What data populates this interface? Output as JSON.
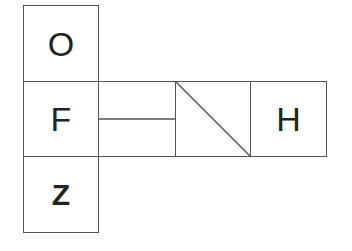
{
  "diagram": {
    "type": "cube-net",
    "stroke_color": "#555555",
    "glyph_color": "#222222",
    "faces": [
      {
        "id": "top",
        "label": "O",
        "position": "column-top"
      },
      {
        "id": "middle-left",
        "label": "F",
        "position": "column-middle"
      },
      {
        "id": "bottom",
        "label": "Z",
        "position": "column-bottom"
      },
      {
        "id": "horizontal-split",
        "label": "",
        "pattern": "horizontal line dividing face in half",
        "position": "row-2"
      },
      {
        "id": "diagonal",
        "label": "",
        "pattern": "diagonal line from top-left to bottom-right",
        "position": "row-3"
      },
      {
        "id": "right",
        "label": "H",
        "position": "row-4"
      }
    ]
  }
}
